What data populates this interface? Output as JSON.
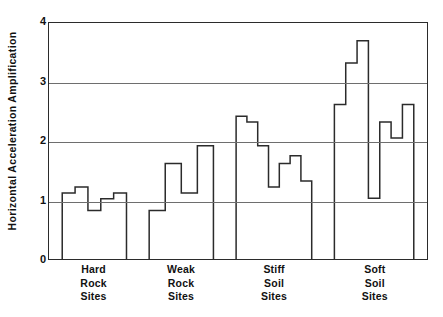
{
  "chart": {
    "type": "bar",
    "title": "",
    "ylabel": "Horizontal Acceleration Amplification",
    "xlabel": "",
    "y_ticks": [
      "0",
      "1",
      "2",
      "3",
      "4"
    ],
    "grid": "horizontal gridlines at 1, 2, 3, 4"
  },
  "chart_data": {
    "type": "bar",
    "title": "",
    "xlabel": "",
    "ylabel": "Horizontal Acceleration Amplification",
    "ylim": [
      0,
      4
    ],
    "yticks": [
      0,
      1,
      2,
      3,
      4
    ],
    "ytick_labels": [
      "0",
      "1",
      "2",
      "3",
      "4"
    ],
    "grid": true,
    "grid_axis": "y",
    "legend": "none",
    "categories": [
      "Hard Rock Sites",
      "Weak Rock Sites",
      "Stiff Soil Sites",
      "Soft Soil Sites"
    ],
    "groups": [
      {
        "name": "Hard Rock Sites",
        "label_lines": [
          "Hard",
          "Rock",
          "Sites"
        ],
        "x_start": 0.035,
        "x_end": 0.205,
        "values": [
          1.12,
          1.22,
          0.82,
          1.02,
          1.12
        ]
      },
      {
        "name": "Weak Rock Sites",
        "label_lines": [
          "Weak",
          "Rock",
          "Sites"
        ],
        "x_start": 0.265,
        "x_end": 0.435,
        "values": [
          0.82,
          1.62,
          1.12,
          1.92
        ]
      },
      {
        "name": "Stiff Soil Sites",
        "label_lines": [
          "Stiff",
          "Soil",
          "Sites"
        ],
        "x_start": 0.495,
        "x_end": 0.695,
        "values": [
          2.42,
          2.32,
          1.92,
          1.22,
          1.62,
          1.75,
          1.32
        ]
      },
      {
        "name": "Soft Soil Sites",
        "label_lines": [
          "Soft",
          "Soil",
          "Sites"
        ],
        "x_start": 0.755,
        "x_end": 0.965,
        "values": [
          2.62,
          3.32,
          3.7,
          1.03,
          2.32,
          2.05,
          2.62
        ]
      }
    ],
    "values_flat": [
      1.12,
      1.22,
      0.82,
      1.02,
      1.12,
      0.82,
      1.62,
      1.12,
      1.92,
      2.42,
      2.32,
      1.92,
      1.22,
      1.62,
      1.75,
      1.32,
      2.62,
      3.32,
      3.7,
      1.03,
      2.32,
      2.05,
      2.62
    ]
  },
  "colors": {
    "line": "#2b2b2b",
    "grid": "#6e6e6e",
    "text": "#111111",
    "background": "#ffffff"
  }
}
